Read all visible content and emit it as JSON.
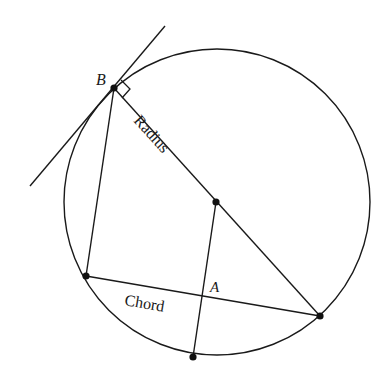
{
  "diagram": {
    "circle": {
      "cx": 217,
      "cy": 202,
      "r": 153
    },
    "points": {
      "B": {
        "x": 114,
        "y": 88,
        "label": "B"
      },
      "center": {
        "x": 216,
        "y": 202
      },
      "diameter_end": {
        "x": 320,
        "y": 316
      },
      "chord_left": {
        "x": 86,
        "y": 276
      },
      "bottom": {
        "x": 193,
        "y": 357
      },
      "A": {
        "x": 203,
        "y": 296,
        "label": "A"
      }
    },
    "labels": {
      "point_b": "B",
      "point_a": "A",
      "radius": "Radius",
      "chord": "Chord"
    },
    "colors": {
      "stroke": "#1a1a1a",
      "background": "#ffffff"
    }
  }
}
